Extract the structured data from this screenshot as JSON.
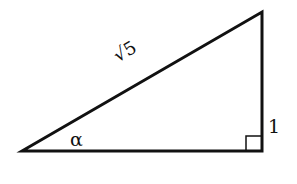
{
  "diagram": {
    "type": "right-triangle",
    "labels": {
      "hypotenuse": "√5",
      "opposite": "1",
      "angle": "α"
    },
    "stroke_color": "#111111",
    "vertices": {
      "left": [
        22,
        150
      ],
      "top_right": [
        261,
        12
      ],
      "bottom_right": [
        261,
        150
      ]
    }
  }
}
